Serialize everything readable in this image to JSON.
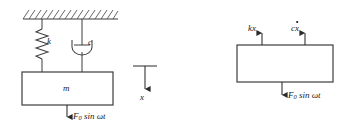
{
  "figure": {
    "stroke_color": "#3d3d3d",
    "text_color": "#1a1a1a",
    "background": "#ffffff",
    "width": 349,
    "height": 132
  },
  "left_diagram": {
    "name": "spring-mass-damper-system",
    "ceiling": {
      "label": "fixed-support-hatching",
      "x1": 23,
      "x2": 118,
      "y": 19,
      "hatch_count": 16
    },
    "spring": {
      "label": "k",
      "element": "spring",
      "cx": 42,
      "top": 26,
      "bottom": 62,
      "coils": 6
    },
    "damper": {
      "label": "c",
      "element": "damper",
      "cx": 82,
      "top": 19,
      "bottom": 72
    },
    "mass": {
      "label": "m",
      "element": "mass-block",
      "x": 22,
      "y": 72,
      "w": 91,
      "h": 33
    },
    "force": {
      "label_prefix": "F",
      "label_sub": "0",
      "label_rest": " sin ωt",
      "full_label": "F0 sin ωt",
      "direction": "down",
      "arrow_x": 67,
      "arrow_top": 105,
      "arrow_bottom": 120
    },
    "displacement": {
      "label": "x",
      "direction": "down",
      "datum_line": {
        "x1": 133,
        "x2": 157,
        "y": 66
      },
      "arrow_x": 145,
      "arrow_top": 66,
      "arrow_bottom": 92
    }
  },
  "right_diagram": {
    "name": "free-body-diagram",
    "block": {
      "element": "mass-block",
      "x": 237,
      "y": 45,
      "w": 96,
      "h": 37
    },
    "forces": [
      {
        "name": "spring-force",
        "label": "kx",
        "direction": "up",
        "arrow_x": 262,
        "arrow_top": 31,
        "arrow_bottom": 45
      },
      {
        "name": "damping-force",
        "label_base": "c",
        "label_var": "x",
        "label_dot": true,
        "full_label": "cẋ",
        "direction": "up",
        "arrow_x": 305,
        "arrow_top": 31,
        "arrow_bottom": 45
      },
      {
        "name": "applied-force",
        "label_prefix": "F",
        "label_sub": "0",
        "label_rest": " sin ωt",
        "full_label": "F0 sin ωt",
        "direction": "down",
        "arrow_x": 282,
        "arrow_top": 82,
        "arrow_bottom": 98
      }
    ]
  }
}
